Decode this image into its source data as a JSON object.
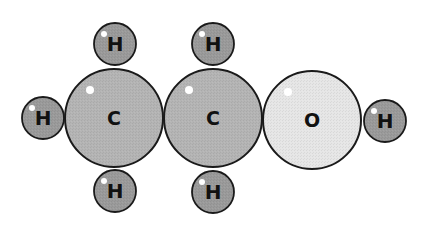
{
  "diagram": {
    "colors": {
      "carbon": "#b4b4b4",
      "oxygen": "#e6e6e6",
      "hydrogen": "#9a9a9a",
      "outline": "#1a1a1a",
      "label": "#111111",
      "highlight": "#ffffff",
      "background": "#ffffff"
    },
    "atoms": [
      {
        "id": "c1",
        "element": "carbon",
        "label": "C",
        "cx": 114,
        "cy": 118,
        "r": 49
      },
      {
        "id": "c2",
        "element": "carbon",
        "label": "C",
        "cx": 213,
        "cy": 118,
        "r": 49
      },
      {
        "id": "o1",
        "element": "oxygen",
        "label": "O",
        "cx": 312,
        "cy": 120,
        "r": 49
      },
      {
        "id": "h1",
        "element": "hydrogen",
        "label": "H",
        "cx": 115,
        "cy": 44,
        "r": 21
      },
      {
        "id": "h2",
        "element": "hydrogen",
        "label": "H",
        "cx": 213,
        "cy": 44,
        "r": 21
      },
      {
        "id": "h3",
        "element": "hydrogen",
        "label": "H",
        "cx": 43,
        "cy": 118,
        "r": 21
      },
      {
        "id": "h4",
        "element": "hydrogen",
        "label": "H",
        "cx": 115,
        "cy": 191,
        "r": 21
      },
      {
        "id": "h5",
        "element": "hydrogen",
        "label": "H",
        "cx": 213,
        "cy": 192,
        "r": 21
      },
      {
        "id": "h6",
        "element": "hydrogen",
        "label": "H",
        "cx": 385,
        "cy": 121,
        "r": 21
      }
    ]
  }
}
